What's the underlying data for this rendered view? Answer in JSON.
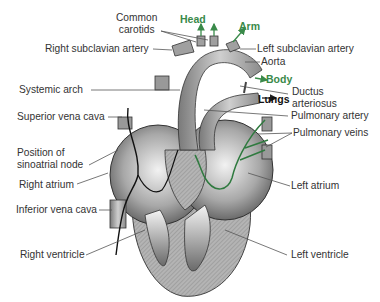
{
  "diagram": {
    "colors": {
      "flow_arrows": "#3a8a4a",
      "leader_lines": "#444444",
      "tissue": "#b8b8b8",
      "nerve": "#111111"
    },
    "labels_left": [
      {
        "id": "common-carotids",
        "text_line1": "Common",
        "text_line2": "carotids"
      },
      {
        "id": "right-subclavian-artery",
        "text": "Right subclavian artery"
      },
      {
        "id": "systemic-arch",
        "text": "Systemic arch"
      },
      {
        "id": "superior-vena-cava",
        "text": "Superior vena cava"
      },
      {
        "id": "sinoatrial-node",
        "text_line1": "Position of",
        "text_line2": "sinoatrial node"
      },
      {
        "id": "right-atrium",
        "text": "Right atrium"
      },
      {
        "id": "inferior-vena-cava",
        "text": "Inferior vena cava"
      },
      {
        "id": "right-ventricle",
        "text": "Right ventricle"
      }
    ],
    "labels_right": [
      {
        "id": "left-subclavian-artery",
        "text": "Left subclavian artery"
      },
      {
        "id": "aorta",
        "text": "Aorta"
      },
      {
        "id": "ductus-arteriosus",
        "text_line1": "Ductus",
        "text_line2": "arteriosus"
      },
      {
        "id": "pulmonary-artery",
        "text": "Pulmonary artery"
      },
      {
        "id": "pulmonary-veins",
        "text": "Pulmonary veins"
      },
      {
        "id": "left-atrium",
        "text": "Left atrium"
      },
      {
        "id": "left-ventricle",
        "text": "Left ventricle"
      }
    ],
    "flow_destinations": [
      {
        "id": "head",
        "text": "Head"
      },
      {
        "id": "arm",
        "text": "Arm"
      },
      {
        "id": "body",
        "text": "Body"
      },
      {
        "id": "lungs",
        "text": "Lungs"
      }
    ]
  }
}
